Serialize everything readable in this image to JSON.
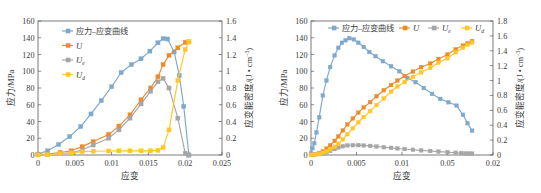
{
  "figure": {
    "panels": [
      "left",
      "right"
    ]
  },
  "colors": {
    "stress_strain": "#7FA8CD",
    "U": "#ED8B2B",
    "Ue": "#A6A6A6",
    "Ud": "#FFC726",
    "axis": "#5a5a5a",
    "text": "#3a3a3a",
    "background": "#ffffff"
  },
  "legend_labels": {
    "stress_strain": "应力–应变曲线",
    "U": "U",
    "Ue_base": "U",
    "Ue_sub": "e",
    "Ud_base": "U",
    "Ud_sub": "d"
  },
  "chart_data": [
    {
      "id": "left-chart",
      "type": "line",
      "title": "",
      "xlabel": "应变",
      "ylabel": "应力/MPa",
      "y2label_base": "应变能密度/(J • cm",
      "y2label_sup": "−3",
      "y2label_tail": ")",
      "xlim": [
        0,
        0.025
      ],
      "ylim": [
        0,
        160
      ],
      "y2lim": [
        0,
        1.6
      ],
      "xticks": [
        0,
        0.005,
        0.01,
        0.015,
        0.02,
        0.025
      ],
      "xticklabels": [
        "0",
        "0.005",
        "0.01",
        "0.015",
        "0.02",
        "0.025"
      ],
      "yticks": [
        0,
        20,
        40,
        60,
        80,
        100,
        120,
        140,
        160
      ],
      "yticklabels": [
        "0",
        "20",
        "40",
        "60",
        "80",
        "100",
        "120",
        "140",
        "160"
      ],
      "y2ticks": [
        0,
        0.2,
        0.4,
        0.6,
        0.8,
        1.0,
        1.2,
        1.4,
        1.6
      ],
      "y2ticklabels": [
        "0",
        "0.2",
        "0.4",
        "0.6",
        "0.8",
        "1",
        "1.2",
        "1.4",
        "1.6"
      ],
      "grid": false,
      "legend_position": "upper-left-vertical",
      "series": [
        {
          "name": "应力–应变曲线",
          "axis": "left",
          "color": "#7FA8CD",
          "x": [
            0.0,
            0.0013,
            0.0028,
            0.0043,
            0.0058,
            0.0072,
            0.0086,
            0.01,
            0.0113,
            0.0127,
            0.014,
            0.0152,
            0.0163,
            0.017,
            0.0176,
            0.0185,
            0.0192,
            0.0198,
            0.0205
          ],
          "y": [
            1,
            5,
            12.5,
            22,
            34,
            49,
            65,
            81.5,
            98.5,
            108,
            115,
            124,
            134,
            139,
            138.5,
            123,
            95,
            58,
            0
          ]
        },
        {
          "name": "U",
          "axis": "right",
          "color": "#ED8B2B",
          "x": [
            0.0,
            0.0013,
            0.003,
            0.0045,
            0.006,
            0.0075,
            0.0096,
            0.011,
            0.0125,
            0.014,
            0.0153,
            0.0163,
            0.017,
            0.0178,
            0.019,
            0.02,
            0.0205
          ],
          "y": [
            0.005,
            0.01,
            0.03,
            0.05,
            0.1,
            0.16,
            0.245,
            0.345,
            0.48,
            0.66,
            0.8,
            0.935,
            1.08,
            1.19,
            1.28,
            1.345,
            1.35
          ]
        },
        {
          "name": "Ue",
          "axis": "right",
          "color": "#A6A6A6",
          "x": [
            0.0,
            0.0013,
            0.003,
            0.0045,
            0.006,
            0.0075,
            0.0096,
            0.011,
            0.0125,
            0.014,
            0.0153,
            0.0163,
            0.017,
            0.0178,
            0.019,
            0.02,
            0.0205
          ],
          "y": [
            0.005,
            0.008,
            0.015,
            0.025,
            0.06,
            0.12,
            0.2,
            0.3,
            0.44,
            0.61,
            0.76,
            0.875,
            0.915,
            0.8,
            0.44,
            0.02,
            0.0
          ]
        },
        {
          "name": "Ud",
          "axis": "right",
          "color": "#FFC726",
          "x": [
            0.0,
            0.0013,
            0.003,
            0.0045,
            0.006,
            0.0075,
            0.0096,
            0.011,
            0.0125,
            0.014,
            0.0153,
            0.0163,
            0.017,
            0.0178,
            0.019,
            0.02,
            0.0205
          ],
          "y": [
            0.0,
            0.005,
            0.015,
            0.025,
            0.04,
            0.045,
            0.048,
            0.05,
            0.05,
            0.05,
            0.05,
            0.055,
            0.09,
            0.3,
            0.89,
            1.26,
            1.35
          ]
        }
      ]
    },
    {
      "id": "right-chart",
      "type": "line",
      "title": "",
      "xlabel": "应变",
      "ylabel": "应力/MPa",
      "y2label_base": "应变能密度/(J • cm",
      "y2label_sup": "−3",
      "y2label_tail": ")",
      "xlim": [
        0,
        0.02
      ],
      "ylim": [
        0,
        160
      ],
      "y2lim": [
        0,
        1.8
      ],
      "xticks": [
        0,
        0.005,
        0.01,
        0.015,
        0.02
      ],
      "xticklabels": [
        "0",
        "0.005",
        "0.01",
        "0.05",
        "0.02"
      ],
      "yticks": [
        0,
        20,
        40,
        60,
        80,
        100,
        120,
        140,
        160
      ],
      "yticklabels": [
        "0",
        "20",
        "40",
        "60",
        "80",
        "100",
        "120",
        "140",
        "160"
      ],
      "y2ticks": [
        0,
        0.2,
        0.4,
        0.6,
        0.8,
        1.0,
        1.2,
        1.4,
        1.6,
        1.8
      ],
      "y2ticklabels": [
        "0",
        "0.2",
        "0.4",
        "0.6",
        "0.8",
        "1",
        "1.2",
        "1.4",
        "1.6",
        "1.8"
      ],
      "grid": false,
      "legend_position": "top-horizontal",
      "series": [
        {
          "name": "应力–应变曲线",
          "axis": "left",
          "color": "#7FA8CD",
          "x": [
            0.0,
            0.00015,
            0.00035,
            0.0006,
            0.0009,
            0.0013,
            0.0017,
            0.0021,
            0.0026,
            0.003,
            0.0034,
            0.0038,
            0.0042,
            0.0047,
            0.0052,
            0.0058,
            0.0064,
            0.0071,
            0.0079,
            0.0088,
            0.0097,
            0.0106,
            0.0115,
            0.0124,
            0.0133,
            0.0142,
            0.0151,
            0.016,
            0.0167,
            0.0172,
            0.0177
          ],
          "y": [
            2,
            8,
            14,
            27,
            45,
            71,
            89,
            105,
            119,
            128,
            134,
            137,
            139.5,
            138,
            134,
            129,
            123,
            118,
            112,
            106,
            100,
            92,
            87,
            80,
            73,
            67,
            63,
            59,
            48,
            38,
            29
          ]
        },
        {
          "name": "U",
          "axis": "right",
          "color": "#ED8B2B",
          "x": [
            0.0,
            0.0004,
            0.0009,
            0.0013,
            0.0017,
            0.0021,
            0.0026,
            0.003,
            0.0035,
            0.004,
            0.0046,
            0.0052,
            0.0058,
            0.0065,
            0.0072,
            0.008,
            0.0088,
            0.0095,
            0.0103,
            0.0112,
            0.0121,
            0.0131,
            0.014,
            0.015,
            0.0159,
            0.0167,
            0.0172,
            0.0177
          ],
          "y": [
            0.005,
            0.01,
            0.025,
            0.05,
            0.085,
            0.13,
            0.19,
            0.25,
            0.33,
            0.41,
            0.49,
            0.57,
            0.64,
            0.71,
            0.79,
            0.87,
            0.94,
            1.0,
            1.06,
            1.12,
            1.18,
            1.23,
            1.29,
            1.35,
            1.42,
            1.47,
            1.5,
            1.53
          ]
        },
        {
          "name": "Ue",
          "axis": "right",
          "color": "#A6A6A6",
          "x": [
            0.0,
            0.0004,
            0.0009,
            0.0013,
            0.0017,
            0.0021,
            0.0026,
            0.003,
            0.0035,
            0.004,
            0.0046,
            0.0052,
            0.0058,
            0.0065,
            0.0072,
            0.008,
            0.0088,
            0.0095,
            0.0103,
            0.0112,
            0.0121,
            0.0131,
            0.014,
            0.015,
            0.0159,
            0.0165,
            0.017,
            0.0174,
            0.0177
          ],
          "y": [
            0.003,
            0.006,
            0.012,
            0.02,
            0.035,
            0.055,
            0.08,
            0.1,
            0.118,
            0.128,
            0.132,
            0.133,
            0.128,
            0.122,
            0.114,
            0.105,
            0.096,
            0.088,
            0.08,
            0.07,
            0.062,
            0.054,
            0.046,
            0.038,
            0.03,
            0.026,
            0.022,
            0.02,
            0.018
          ]
        },
        {
          "name": "Ud",
          "axis": "right",
          "color": "#FFC726",
          "x": [
            0.0,
            0.0004,
            0.0009,
            0.0013,
            0.0017,
            0.0021,
            0.0026,
            0.003,
            0.0035,
            0.004,
            0.0046,
            0.0052,
            0.0058,
            0.0065,
            0.0072,
            0.008,
            0.0088,
            0.0095,
            0.0103,
            0.0112,
            0.0121,
            0.0131,
            0.014,
            0.015,
            0.0159,
            0.0167,
            0.0172,
            0.0177
          ],
          "y": [
            0.002,
            0.005,
            0.013,
            0.03,
            0.05,
            0.075,
            0.11,
            0.15,
            0.21,
            0.28,
            0.36,
            0.44,
            0.51,
            0.59,
            0.67,
            0.76,
            0.85,
            0.92,
            0.98,
            1.05,
            1.11,
            1.17,
            1.24,
            1.3,
            1.38,
            1.44,
            1.48,
            1.51
          ]
        }
      ]
    }
  ]
}
